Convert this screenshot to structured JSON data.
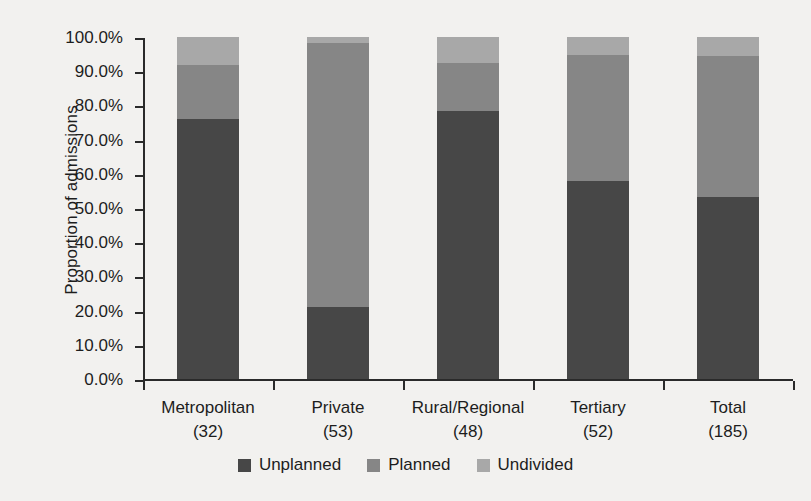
{
  "chart_data": {
    "type": "bar",
    "subtype": "stacked-bar-100-percent",
    "title": "",
    "xlabel": "",
    "ylabel": "Proportion of admissions",
    "ylim": [
      0,
      100
    ],
    "yunit": "%",
    "grid": false,
    "legend_position": "bottom-center",
    "categories": [
      "Metropolitan",
      "Private",
      "Rural/Regional",
      "Tertiary",
      "Total"
    ],
    "category_counts": [
      "(32)",
      "(53)",
      "(48)",
      "(52)",
      "(185)"
    ],
    "category_labels": [
      "Metropolitan\n(32)",
      "Private\n(53)",
      "Rural/Regional\n(48)",
      "Tertiary\n(52)",
      "Total\n(185)"
    ],
    "ytick_labels": [
      "100.0%",
      "90.0%",
      "80.0%",
      "70.0%",
      "60.0%",
      "50.0%",
      "40.0%",
      "30.0%",
      "20.0%",
      "10.0%",
      "0.0%"
    ],
    "ytick_values": [
      100,
      90,
      80,
      70,
      60,
      50,
      40,
      30,
      20,
      10,
      0
    ],
    "series": [
      {
        "name": "Unplanned",
        "color": "#474747",
        "values": [
          76.0,
          21.0,
          78.4,
          58.0,
          53.2
        ]
      },
      {
        "name": "Planned",
        "color": "#868686",
        "values": [
          15.8,
          77.2,
          14.0,
          36.8,
          41.2
        ]
      },
      {
        "name": "Undivided",
        "color": "#a8a8a8",
        "values": [
          8.2,
          1.8,
          7.6,
          5.2,
          5.6
        ]
      }
    ]
  },
  "legend": {
    "items": [
      {
        "label": "Unplanned",
        "color": "#474747"
      },
      {
        "label": "Planned",
        "color": "#868686"
      },
      {
        "label": "Undivided",
        "color": "#a8a8a8"
      }
    ]
  },
  "colors": {
    "background": "#f2f1ef",
    "axis": "#2a2a2a",
    "text": "#1d1d1d",
    "unplanned": "#474747",
    "planned": "#868686",
    "undivided": "#a8a8a8"
  }
}
